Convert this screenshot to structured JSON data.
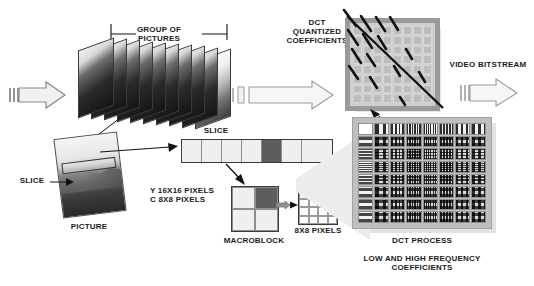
{
  "diagram": {
    "labels": {
      "group_of_pictures": "GROUP OF\nPICTURES",
      "slice_top": "SLICE",
      "slice_left": "SLICE",
      "picture": "PICTURE",
      "pixels_note": "Y  16X16 PIXELS\nC  8X8 PIXELS",
      "macroblock": "MACROBLOCK",
      "block": "BLOCK",
      "block_pixels": "8X8 PIXELS",
      "dct_quantized_coefficients": "DCT\nQUANTIZED\nCOEFFICIENTS",
      "video_bitstream": "VIDEO BITSTREAM",
      "dct_process": "DCT PROCESS",
      "frequency_caption": "LOW AND HIGH FREQUENCY\nCOEFFICIENTS"
    },
    "counts": {
      "gop_frames": 10,
      "slice_cells": 7,
      "slice_dark_index": 4,
      "macroblock_cells": 4,
      "macroblock_dark_index": 1,
      "block_grid": "4x4",
      "quant_grid": "8x8",
      "dct_grid": "8x8"
    },
    "colors": {
      "ink": "#1a1a1a",
      "panel": "#bfbfbf",
      "cell_light": "#efefef",
      "cell_dark": "#5d5d5d",
      "outline": "#3a3a3a",
      "funnel": "#ececec",
      "background": "#ffffff"
    }
  }
}
